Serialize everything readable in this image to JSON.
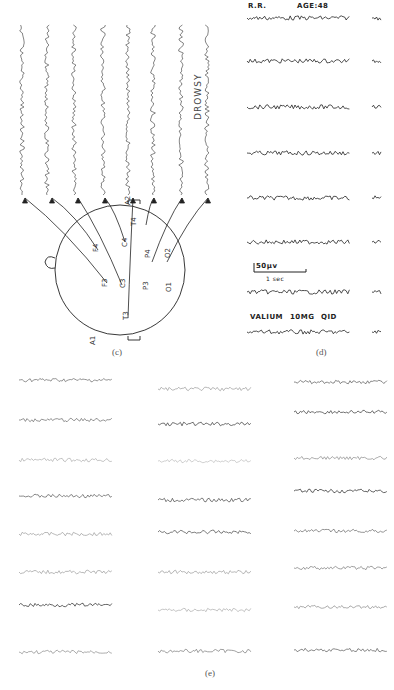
{
  "figure": {
    "panel_c": {
      "label": "(c)",
      "state_label": "DROWSY",
      "electrodes": [
        "F3",
        "F4",
        "C3",
        "C4",
        "T3",
        "T4",
        "P3",
        "P4",
        "O1",
        "O2",
        "A1",
        "A2"
      ],
      "trace_count": 8
    },
    "panel_d": {
      "label": "(d)",
      "patient": "R.R.",
      "age": "AGE:48",
      "scale_amplitude": "50μv",
      "scale_time": "1 sec",
      "medication": "VALIUM",
      "dose": "10MG",
      "frequency": "QID",
      "trace_count": 8
    },
    "panel_e": {
      "label": "(e)",
      "columns": 3,
      "rows_per_column": 8
    }
  }
}
